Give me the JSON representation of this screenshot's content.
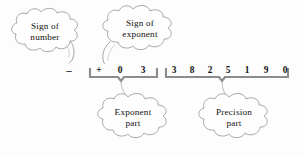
{
  "diagram": {
    "background_color": "#fdfdfd",
    "ink_color": "#111111",
    "cloud_outline_color": "#9a9a9a",
    "brace_color": "#8c8c8c",
    "callouts": {
      "sign_of_number": {
        "line1": "Sign  of",
        "line2": "number"
      },
      "sign_of_exponent": {
        "line1": "Sign  of",
        "line2": "exponent"
      },
      "exponent_part": {
        "line1": "Exponent",
        "line2": "part"
      },
      "precision_part": {
        "line1": "Precision",
        "line2": "part"
      }
    },
    "number": {
      "sign": "–",
      "exponent_digits": [
        "+",
        "0",
        "3"
      ],
      "precision_digits": [
        "3",
        "8",
        "2",
        "5",
        "1",
        "9",
        "0"
      ]
    }
  }
}
